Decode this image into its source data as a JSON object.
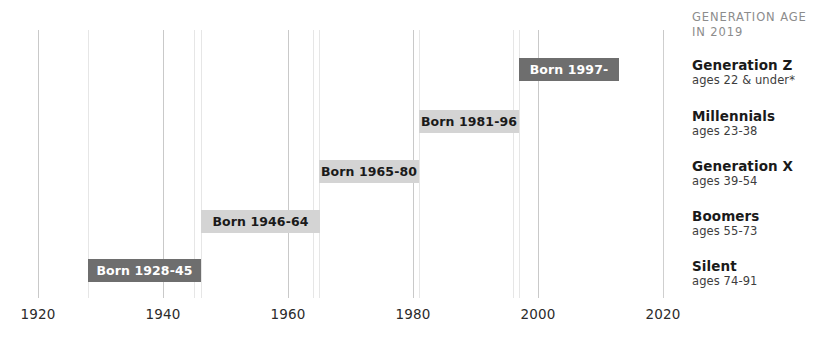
{
  "chart_data": {
    "type": "bar",
    "title": "",
    "subtitle": "",
    "xlabel": "",
    "ylabel": "",
    "orientation": "horizontal",
    "xlim": [
      1920,
      2020
    ],
    "grid": true,
    "xticks": [
      "1920",
      "1940",
      "1960",
      "1980",
      "2000",
      "2020"
    ],
    "xtick_values": [
      1920,
      1940,
      1960,
      1980,
      2000,
      2020
    ],
    "minor_gridline_years": [
      1928,
      1945,
      1946,
      1964,
      1965,
      1980,
      1981,
      1996,
      1997
    ],
    "legend_position": "right",
    "categories": [
      "Generation Z",
      "Millennials",
      "Generation X",
      "Boomers",
      "Silent"
    ],
    "bars": [
      {
        "name": "Generation Z",
        "label": "Born 1997-",
        "start": 1997,
        "end": 2012,
        "style": "dark",
        "row": 0
      },
      {
        "name": "Millennials",
        "label": "Born 1981-96",
        "start": 1981,
        "end": 1996,
        "style": "light",
        "row": 1
      },
      {
        "name": "Generation X",
        "label": "Born 1965-80",
        "start": 1965,
        "end": 1980,
        "style": "light",
        "row": 2
      },
      {
        "name": "Boomers",
        "label": "Born 1946-64",
        "start": 1946,
        "end": 1964,
        "style": "light",
        "row": 3
      },
      {
        "name": "Silent",
        "label": "Born 1928-45",
        "start": 1928,
        "end": 1945,
        "style": "dark",
        "row": 4
      }
    ],
    "colors": {
      "bar_dark": "#6e6e6e",
      "bar_light": "#d4d4d4",
      "bar_dark_text": "#ffffff",
      "bar_light_text": "#1a1a1a",
      "gridline_major": "#c9c9c9",
      "gridline_minor": "#e6e6e6",
      "background": "#ffffff",
      "legend_title": "#8c8c8c"
    }
  },
  "legend": {
    "title_line1": "Generation age",
    "title_line2": "in 2019",
    "entries": [
      {
        "name": "Generation Z",
        "ages": "ages 22 & under*"
      },
      {
        "name": "Millennials",
        "ages": "ages 23-38"
      },
      {
        "name": "Generation X",
        "ages": "ages 39-54"
      },
      {
        "name": "Boomers",
        "ages": "ages 55-73"
      },
      {
        "name": "Silent",
        "ages": "ages 74-91"
      }
    ]
  }
}
